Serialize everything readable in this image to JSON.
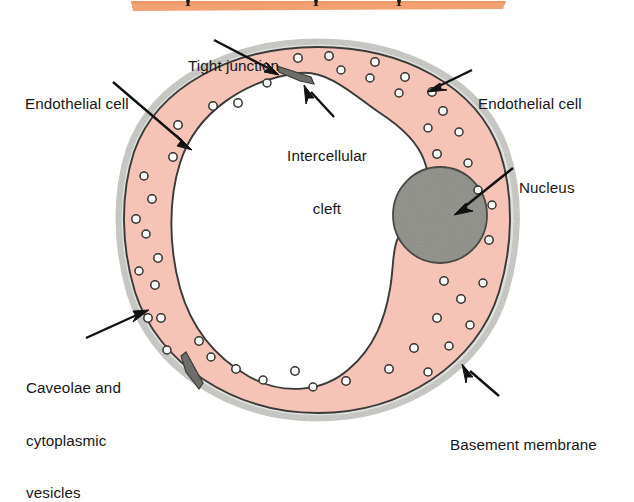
{
  "figure": {
    "colors": {
      "cytoplasm": "#f6c4b6",
      "nucleus": "#8e8e88",
      "basement_membrane": "#d8d8d4",
      "outline": "#3a3a3a",
      "vesicle_fill": "#ffffff",
      "junction": "#6e6e68",
      "top_band": "#f2a172",
      "label_text": "#171717"
    }
  },
  "top_band": {
    "name": "orange-band",
    "marker_count": 3
  },
  "labels": [
    {
      "id": "tight-junction",
      "text": "Tight junction",
      "lines": [
        "Tight junction"
      ]
    },
    {
      "id": "endothelial-left",
      "text": "Endothelial cell",
      "lines": [
        "Endothelial cell"
      ]
    },
    {
      "id": "endothelial-right",
      "text": "Endothelial cell",
      "lines": [
        "Endothelial cell"
      ]
    },
    {
      "id": "intercellular-cleft",
      "text": "Intercellular cleft",
      "lines": [
        "Intercellular",
        "cleft"
      ]
    },
    {
      "id": "nucleus",
      "text": "Nucleus",
      "lines": [
        "Nucleus"
      ]
    },
    {
      "id": "caveolae",
      "text": "Caveolae and cytoplasmic vesicles",
      "lines": [
        "Caveolae and",
        "cytoplasmic",
        "vesicles"
      ]
    },
    {
      "id": "basement-membrane",
      "text": "Basement membrane",
      "lines": [
        "Basement membrane"
      ]
    }
  ],
  "label_lines": {
    "tight_junction_1": "Tight junction",
    "endothelial_left_1": "Endothelial cell",
    "endothelial_right_1": "Endothelial cell",
    "cleft_1": "Intercellular",
    "cleft_2": "cleft",
    "nucleus_1": "Nucleus",
    "caveolae_1": "Caveolae and",
    "caveolae_2": "cytoplasmic",
    "caveolae_3": "vesicles",
    "basement_1": "Basement membrane"
  },
  "structures": {
    "lumen": "lumen (white interior)",
    "cytoplasm_ring": "endothelial cytoplasm ring",
    "nucleus_shape": "nucleus ellipse",
    "vesicle_count": 46,
    "junction_count": 2
  }
}
